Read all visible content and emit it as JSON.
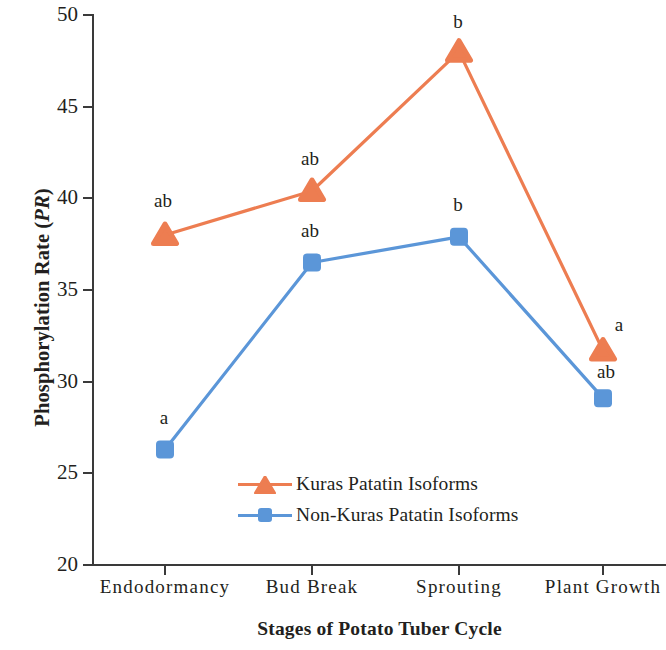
{
  "chart_data": {
    "type": "line",
    "title": "",
    "xlabel": "Stages of Potato Tuber Cycle",
    "ylabel": "Phosphorylation Rate (PR)",
    "ylabel_plain": "Phosphorylation Rate (",
    "ylabel_italic": "PR",
    "ylabel_tail": ")",
    "categories": [
      "Endodormancy",
      "Bud Break",
      "Sprouting",
      "Plant Growth"
    ],
    "ylim": [
      20,
      50
    ],
    "yticks": [
      20,
      25,
      30,
      35,
      40,
      45,
      50
    ],
    "ytick_labels": [
      "20",
      "25",
      "30",
      "35",
      "40",
      "45",
      "50"
    ],
    "grid": false,
    "legend_position": "inside-lower-center",
    "series": [
      {
        "name": "Kuras Patatin Isoforms",
        "color": "#ED7D51",
        "marker": "triangle",
        "values": [
          38.0,
          40.4,
          48.0,
          31.7
        ],
        "point_labels": [
          "ab",
          "ab",
          "b",
          "a"
        ]
      },
      {
        "name": "Non-Kuras Patatin Isoforms",
        "color": "#5B96D8",
        "marker": "square",
        "values": [
          26.3,
          36.5,
          37.9,
          29.1
        ],
        "point_labels": [
          "a",
          "ab",
          "b",
          "ab"
        ]
      }
    ]
  },
  "legend": {
    "items": [
      {
        "label": "Kuras Patatin Isoforms",
        "color": "#ED7D51",
        "marker": "triangle"
      },
      {
        "label": "Non-Kuras Patatin Isoforms",
        "color": "#5B96D8",
        "marker": "square"
      }
    ]
  },
  "colors": {
    "kuras": "#ED7D51",
    "non_kuras": "#5B96D8",
    "axis": "#3a3a3a",
    "text": "#231f20",
    "background": "#ffffff"
  }
}
